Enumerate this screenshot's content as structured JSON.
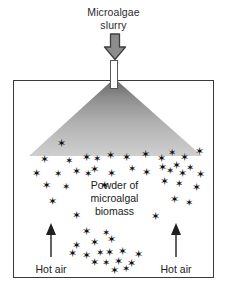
{
  "figure": {
    "background_color": "#ffffff",
    "outline_color": "#3a3a3a"
  },
  "inlet": {
    "label": "Microalgae\nslurry",
    "arrow_icon": "down-block-arrow-icon",
    "arrow_fill": "#8c8c8c",
    "arrow_stroke": "#3f3f3f",
    "nozzle_icon": "spray-nozzle-icon"
  },
  "chamber": {
    "name": "spray-drying-chamber",
    "border_color": "#3a3a3a"
  },
  "spray": {
    "icon": "spray-cone-icon",
    "color_top": "#6e6e6e",
    "color_bottom": "#c9c9c9"
  },
  "powder": {
    "label": "Powder of\nmicroalgal\nbiomass",
    "particle_glyph": "✶",
    "particle_color": "#111111"
  },
  "hot_air": {
    "left_label": "Hot air",
    "right_label": "Hot air",
    "arrow_icon": "up-arrow-icon",
    "arrow_color": "#202020"
  },
  "particles": [
    {
      "x": 47,
      "y": 62,
      "s": 11
    },
    {
      "x": 30,
      "y": 78,
      "s": 11
    },
    {
      "x": 55,
      "y": 80,
      "s": 10
    },
    {
      "x": 72,
      "y": 76,
      "s": 11
    },
    {
      "x": 83,
      "y": 78,
      "s": 10
    },
    {
      "x": 96,
      "y": 74,
      "s": 11
    },
    {
      "x": 112,
      "y": 76,
      "s": 11
    },
    {
      "x": 131,
      "y": 73,
      "s": 11
    },
    {
      "x": 147,
      "y": 77,
      "s": 11
    },
    {
      "x": 158,
      "y": 72,
      "s": 10
    },
    {
      "x": 170,
      "y": 76,
      "s": 11
    },
    {
      "x": 185,
      "y": 70,
      "s": 11
    },
    {
      "x": 22,
      "y": 92,
      "s": 11
    },
    {
      "x": 44,
      "y": 93,
      "s": 10
    },
    {
      "x": 62,
      "y": 90,
      "s": 11
    },
    {
      "x": 74,
      "y": 93,
      "s": 10
    },
    {
      "x": 80,
      "y": 88,
      "s": 11
    },
    {
      "x": 97,
      "y": 92,
      "s": 11
    },
    {
      "x": 118,
      "y": 88,
      "s": 10
    },
    {
      "x": 132,
      "y": 91,
      "s": 11
    },
    {
      "x": 148,
      "y": 86,
      "s": 11
    },
    {
      "x": 156,
      "y": 90,
      "s": 10
    },
    {
      "x": 162,
      "y": 84,
      "s": 11
    },
    {
      "x": 168,
      "y": 92,
      "s": 11
    },
    {
      "x": 176,
      "y": 87,
      "s": 10
    },
    {
      "x": 186,
      "y": 93,
      "s": 11
    },
    {
      "x": 32,
      "y": 104,
      "s": 11
    },
    {
      "x": 52,
      "y": 106,
      "s": 10
    },
    {
      "x": 90,
      "y": 104,
      "s": 11
    },
    {
      "x": 150,
      "y": 100,
      "s": 11
    },
    {
      "x": 165,
      "y": 103,
      "s": 10
    },
    {
      "x": 182,
      "y": 106,
      "s": 11
    },
    {
      "x": 38,
      "y": 120,
      "s": 11
    },
    {
      "x": 160,
      "y": 118,
      "s": 11
    },
    {
      "x": 175,
      "y": 122,
      "s": 10
    },
    {
      "x": 62,
      "y": 134,
      "s": 11
    },
    {
      "x": 141,
      "y": 135,
      "s": 11
    },
    {
      "x": 72,
      "y": 150,
      "s": 11
    },
    {
      "x": 92,
      "y": 152,
      "s": 10
    },
    {
      "x": 62,
      "y": 164,
      "s": 11
    },
    {
      "x": 80,
      "y": 161,
      "s": 11
    },
    {
      "x": 97,
      "y": 158,
      "s": 11
    },
    {
      "x": 58,
      "y": 172,
      "s": 11
    },
    {
      "x": 72,
      "y": 174,
      "s": 11
    },
    {
      "x": 86,
      "y": 172,
      "s": 10
    },
    {
      "x": 95,
      "y": 171,
      "s": 11
    },
    {
      "x": 108,
      "y": 170,
      "s": 11
    },
    {
      "x": 124,
      "y": 173,
      "s": 11
    },
    {
      "x": 80,
      "y": 181,
      "s": 11
    },
    {
      "x": 92,
      "y": 182,
      "s": 10
    },
    {
      "x": 104,
      "y": 180,
      "s": 11
    },
    {
      "x": 117,
      "y": 182,
      "s": 11
    },
    {
      "x": 100,
      "y": 189,
      "s": 11
    },
    {
      "x": 112,
      "y": 188,
      "s": 10
    }
  ]
}
